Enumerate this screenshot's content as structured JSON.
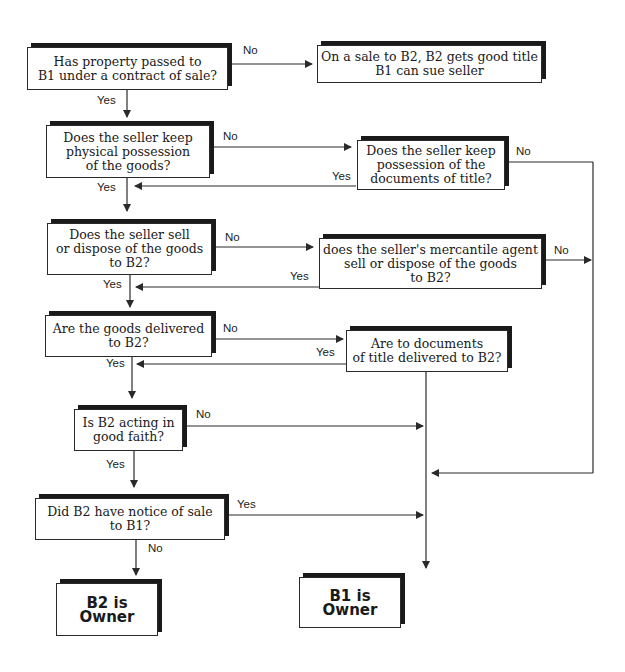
{
  "diagram": {
    "type": "flowchart",
    "nodes": {
      "q_property_passed": "Has property passed to\nB1 under a contract of sale?",
      "r_sale_to_b2": "On a sale to B2, B2 gets good title\nB1 can sue seller",
      "q_seller_keeps_goods": "Does the seller keep\nphysical possession\nof the goods?",
      "q_seller_keeps_documents": "Does the seller keep\npossession of the\ndocuments of title?",
      "q_seller_sells_to_b2": "Does the seller sell\nor dispose of the goods\nto B2?",
      "q_agent_sells_to_b2": "does the seller's mercantile agent\nsell or dispose of the goods\nto B2?",
      "q_goods_delivered": "Are the goods delivered\nto B2?",
      "q_documents_delivered": "Are to documents\nof title delivered to B2?",
      "q_good_faith": "Is B2 acting in\ngood faith?",
      "q_notice_of_sale": "Did B2 have notice of sale\nto B1?",
      "r_b2_owner": "B2 is Owner",
      "r_b1_owner": "B1 is Owner"
    },
    "labels": {
      "property_no": "No",
      "property_yes": "Yes",
      "keeps_goods_no": "No",
      "keeps_goods_yes": "Yes",
      "keeps_docs_no": "No",
      "keeps_docs_yes": "Yes",
      "sells_no": "No",
      "sells_yes": "Yes",
      "agent_no": "No",
      "agent_yes": "Yes",
      "delivered_no": "No",
      "delivered_yes": "Yes",
      "docs_delivered_yes": "Yes",
      "good_faith_no": "No",
      "good_faith_yes": "Yes",
      "notice_yes": "Yes",
      "notice_no": "No"
    },
    "edges": [
      {
        "from": "q_property_passed",
        "to": "r_sale_to_b2",
        "label": "No"
      },
      {
        "from": "q_property_passed",
        "to": "q_seller_keeps_goods",
        "label": "Yes"
      },
      {
        "from": "q_seller_keeps_goods",
        "to": "q_seller_keeps_documents",
        "label": "No"
      },
      {
        "from": "q_seller_keeps_goods",
        "to": "q_seller_sells_to_b2",
        "label": "Yes"
      },
      {
        "from": "q_seller_keeps_documents",
        "to": "q_seller_sells_to_b2",
        "label": "Yes"
      },
      {
        "from": "q_seller_keeps_documents",
        "to": "r_b1_owner",
        "label": "No"
      },
      {
        "from": "q_seller_sells_to_b2",
        "to": "q_agent_sells_to_b2",
        "label": "No"
      },
      {
        "from": "q_seller_sells_to_b2",
        "to": "q_goods_delivered",
        "label": "Yes"
      },
      {
        "from": "q_agent_sells_to_b2",
        "to": "q_goods_delivered",
        "label": "Yes"
      },
      {
        "from": "q_agent_sells_to_b2",
        "to": "r_b1_owner",
        "label": "No"
      },
      {
        "from": "q_goods_delivered",
        "to": "q_documents_delivered",
        "label": "No"
      },
      {
        "from": "q_goods_delivered",
        "to": "q_good_faith",
        "label": "Yes"
      },
      {
        "from": "q_documents_delivered",
        "to": "q_good_faith",
        "label": "Yes"
      },
      {
        "from": "q_documents_delivered",
        "to": "r_b1_owner",
        "label": ""
      },
      {
        "from": "q_good_faith",
        "to": "r_b1_owner",
        "label": "No"
      },
      {
        "from": "q_good_faith",
        "to": "q_notice_of_sale",
        "label": "Yes"
      },
      {
        "from": "q_notice_of_sale",
        "to": "r_b1_owner",
        "label": "Yes"
      },
      {
        "from": "q_notice_of_sale",
        "to": "r_b2_owner",
        "label": "No"
      }
    ],
    "colors": {
      "line": "#2a2a2a",
      "shadow": "#1a1a1a",
      "background": "#ffffff"
    }
  }
}
